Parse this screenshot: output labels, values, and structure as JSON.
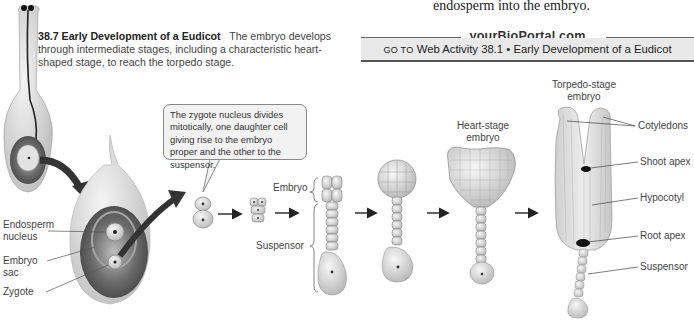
{
  "page": {
    "top_body_text": "endosperm into the embryo."
  },
  "figure": {
    "number": "38.7",
    "title": "Early Development of a Eudicot",
    "caption": "The embryo develops through intermediate stages, including a characteristic heart-shaped stage, to reach the torpedo stage."
  },
  "portal": {
    "site": "yourBioPortal.com",
    "goto": "GO TO",
    "activity": "Web Activity 38.1 • Early Development of a Eudicot"
  },
  "callout": {
    "text": "The zygote nucleus divides mitotically, one daughter cell giving rise to the embryo proper and the other to the suspensor."
  },
  "labels": {
    "endosperm_nucleus_1": "Endosperm",
    "endosperm_nucleus_2": "nucleus",
    "embryo_sac_1": "Embryo",
    "embryo_sac_2": "sac",
    "zygote": "Zygote",
    "embryo": "Embryo",
    "suspensor": "Suspensor",
    "heart_stage_1": "Heart-stage",
    "heart_stage_2": "embryo",
    "torpedo_stage_1": "Torpedo-stage",
    "torpedo_stage_2": "embryo",
    "cotyledons": "Cotyledons",
    "shoot_apex": "Shoot apex",
    "hypocotyl": "Hypocotyl",
    "root_apex": "Root apex",
    "suspensor_torpedo": "Suspensor"
  },
  "colors": {
    "ovule": "#d8d8d8",
    "embryo_sac": "#555555",
    "cell": "#e6e6e6",
    "arrow": "#333333",
    "portal_bg": "#e9e9e9"
  }
}
